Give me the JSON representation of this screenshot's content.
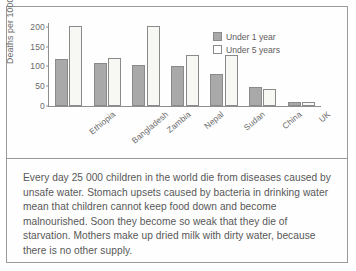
{
  "chart_data": {
    "type": "bar",
    "title": "",
    "xlabel": "",
    "ylabel": "Deaths per 1000 live births",
    "ylim": [
      0,
      210
    ],
    "yticks": [
      0,
      50,
      100,
      150,
      200
    ],
    "ytick_labels": [
      "0",
      "50",
      "100",
      "150",
      "200"
    ],
    "grid": false,
    "legend_position": "top-right",
    "categories": [
      "Ethiopia",
      "Bangladesh",
      "Zambia",
      "Nepal",
      "Sudan",
      "China",
      "UK"
    ],
    "series": [
      {
        "name": "Under 1 year",
        "color": "#a9a9a9",
        "values": [
          120,
          108,
          105,
          100,
          80,
          47,
          9
        ]
      },
      {
        "name": "Under 5 years",
        "color": "#f7f7f4",
        "values": [
          202,
          122,
          202,
          130,
          130,
          44,
          10
        ]
      }
    ]
  },
  "legend": {
    "items": [
      {
        "label": "Under 1 year"
      },
      {
        "label": "Under 5 years"
      }
    ]
  },
  "caption": {
    "text": "Every day 25 000 children in the world die from diseases caused by unsafe water. Stomach upsets caused by bacteria in drinking water mean that children cannot keep food down and become malnourished. Soon they become so weak that they die of starvation. Mothers make up dried milk with dirty water, because there is no other supply."
  },
  "colors": {
    "under_1_year_fill": "#a9a9a9",
    "under_5_years_fill": "#f7f7f4",
    "stroke": "#8a8a8a",
    "border": "#9a9a9a",
    "text": "#5d5d5d"
  }
}
